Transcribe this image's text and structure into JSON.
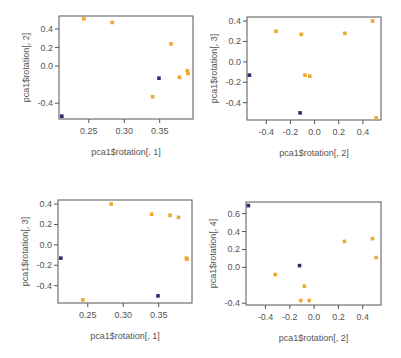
{
  "chart_data": [
    {
      "type": "scatter",
      "title": "",
      "xlabel": "pca1$rotation[, 1]",
      "ylabel": "pca1$rotation[, 2]",
      "xlim": [
        0.208,
        0.397
      ],
      "ylim": [
        -0.57,
        0.54
      ],
      "xticks": [
        0.25,
        0.3,
        0.35
      ],
      "xtick_labels": [
        "0.25",
        "0.30",
        "0.35"
      ],
      "yticks": [
        -0.4,
        0.0,
        0.2,
        0.4
      ],
      "ytick_labels": [
        "-0.4",
        "0.0",
        "0.2",
        "0.4"
      ],
      "grid": false,
      "series": [
        {
          "name": "group-orange",
          "color": "#f0a830",
          "x": [
            0.243,
            0.283,
            0.366,
            0.378,
            0.389,
            0.39,
            0.34
          ],
          "y": [
            0.51,
            0.47,
            0.24,
            -0.12,
            -0.05,
            -0.08,
            -0.33
          ]
        },
        {
          "name": "group-navy",
          "color": "#2b2c6e",
          "x": [
            0.349,
            0.212
          ],
          "y": [
            -0.13,
            -0.54
          ]
        }
      ]
    },
    {
      "type": "scatter",
      "title": "",
      "xlabel": "pca1$rotation[, 2]",
      "ylabel": "pca1$rotation[, 3]",
      "xlim": [
        -0.56,
        0.55
      ],
      "ylim": [
        -0.57,
        0.44
      ],
      "xticks": [
        -0.4,
        -0.2,
        0.0,
        0.2,
        0.4
      ],
      "xtick_labels": [
        "-0.4",
        "-0.2",
        "0.0",
        "0.2",
        "0.4"
      ],
      "yticks": [
        -0.4,
        -0.2,
        0.0,
        0.2,
        0.4
      ],
      "ytick_labels": [
        "-0.4",
        "-0.2",
        "0.0",
        "0.2",
        "0.4"
      ],
      "grid": false,
      "series": [
        {
          "name": "group-orange",
          "color": "#f0a830",
          "x": [
            -0.32,
            -0.11,
            0.25,
            0.48,
            -0.08,
            -0.04,
            0.51
          ],
          "y": [
            0.3,
            0.27,
            0.28,
            0.4,
            -0.13,
            -0.14,
            -0.55
          ]
        },
        {
          "name": "group-navy",
          "color": "#2b2c6e",
          "x": [
            -0.54,
            -0.12
          ],
          "y": [
            -0.13,
            -0.5
          ]
        }
      ]
    },
    {
      "type": "scatter",
      "title": "",
      "xlabel": "pca1$rotation[, 1]",
      "ylabel": "pca1$rotation[, 3]",
      "xlim": [
        0.208,
        0.397
      ],
      "ylim": [
        -0.57,
        0.44
      ],
      "xticks": [
        0.25,
        0.3,
        0.35
      ],
      "xtick_labels": [
        "0.25",
        "0.30",
        "0.35"
      ],
      "yticks": [
        -0.4,
        -0.2,
        0.0,
        0.2,
        0.4
      ],
      "ytick_labels": [
        "-0.4",
        "-0.2",
        "0.0",
        "0.2",
        "0.4"
      ],
      "grid": false,
      "series": [
        {
          "name": "group-orange",
          "color": "#f0a830",
          "x": [
            0.243,
            0.283,
            0.34,
            0.366,
            0.378,
            0.389,
            0.39
          ],
          "y": [
            -0.54,
            0.4,
            0.3,
            0.29,
            0.27,
            -0.13,
            -0.14
          ]
        },
        {
          "name": "group-navy",
          "color": "#2b2c6e",
          "x": [
            0.349,
            0.212
          ],
          "y": [
            -0.5,
            -0.13
          ]
        }
      ]
    },
    {
      "type": "scatter",
      "title": "",
      "xlabel": "pca1$rotation[, 2]",
      "ylabel": "pca1$rotation[, 4]",
      "xlim": [
        -0.56,
        0.55
      ],
      "ylim": [
        -0.42,
        0.73
      ],
      "xticks": [
        -0.4,
        -0.2,
        0.0,
        0.2,
        0.4
      ],
      "xtick_labels": [
        "-0.4",
        "-0.2",
        "0.0",
        "0.2",
        "0.4"
      ],
      "yticks": [
        -0.4,
        0.0,
        0.2,
        0.4,
        0.6
      ],
      "ytick_labels": [
        "-0.4",
        "0.0",
        "0.2",
        "0.4",
        "0.6"
      ],
      "grid": false,
      "series": [
        {
          "name": "group-orange",
          "color": "#f0a830",
          "x": [
            -0.32,
            -0.08,
            -0.11,
            -0.04,
            0.25,
            0.48,
            0.51
          ],
          "y": [
            -0.08,
            -0.21,
            -0.37,
            -0.37,
            0.29,
            0.32,
            0.11
          ]
        },
        {
          "name": "group-navy",
          "color": "#2b2c6e",
          "x": [
            -0.54,
            -0.12
          ],
          "y": [
            0.69,
            0.02
          ]
        }
      ]
    }
  ],
  "panels": [
    {
      "xlabel": "pca1$rotation[, 1]",
      "ylabel": "pca1$rotation[, 2]"
    },
    {
      "xlabel": "pca1$rotation[, 2]",
      "ylabel": "pca1$rotation[, 3]"
    },
    {
      "xlabel": "pca1$rotation[, 1]",
      "ylabel": "pca1$rotation[, 3]"
    },
    {
      "xlabel": "pca1$rotation[, 2]",
      "ylabel": "pca1$rotation[, 4]"
    }
  ],
  "colors": {
    "orange": "#f0a830",
    "navy": "#2b2c6e",
    "axis": "#555555"
  }
}
